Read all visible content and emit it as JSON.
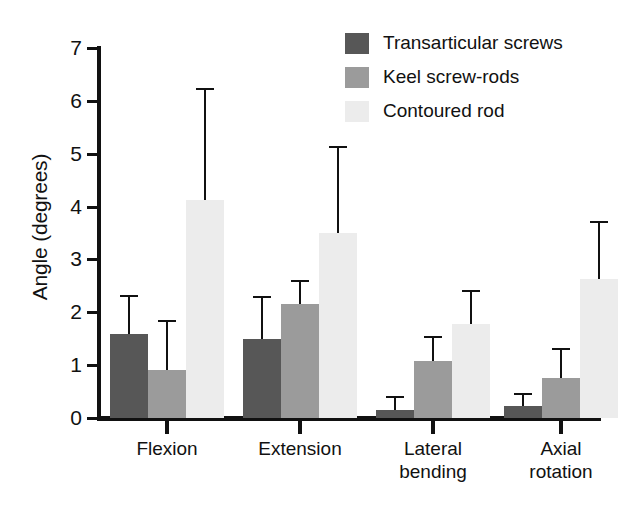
{
  "chart_data": {
    "type": "bar",
    "title": "",
    "xlabel": "",
    "ylabel": "Angle (degrees)",
    "ylim": [
      0,
      7
    ],
    "yticks": [
      0,
      1,
      2,
      3,
      4,
      5,
      6,
      7
    ],
    "ytick_labels": [
      "0",
      "1",
      "2",
      "3",
      "4",
      "5",
      "6",
      "7"
    ],
    "grid": false,
    "legend_position": "top-right",
    "categories": [
      "Flexion",
      "Extension",
      "Lateral\nbending",
      "Axial\nrotation"
    ],
    "series": [
      {
        "name": "Transarticular screws",
        "color": "#575757",
        "values": [
          1.59,
          1.5,
          0.15,
          0.23
        ],
        "errors_upper": [
          0.74,
          0.8,
          0.27,
          0.25
        ]
      },
      {
        "name": "Keel screw-rods",
        "color": "#9b9b9b",
        "values": [
          0.9,
          2.15,
          1.08,
          0.76
        ],
        "errors_upper": [
          0.95,
          0.47,
          0.47,
          0.57
        ]
      },
      {
        "name": "Contoured rod",
        "color": "#ececec",
        "values": [
          4.12,
          3.5,
          1.78,
          2.63
        ],
        "errors_upper": [
          2.12,
          1.65,
          0.64,
          1.1
        ]
      }
    ]
  },
  "legend": {
    "items": [
      {
        "label": "Transarticular screws",
        "swatch": "#575757"
      },
      {
        "label": "Keel screw-rods",
        "swatch": "#9b9b9b"
      },
      {
        "label": "Contoured rod",
        "swatch": "#ececec"
      }
    ]
  },
  "axis": {
    "y_title": "Angle (degrees)"
  }
}
